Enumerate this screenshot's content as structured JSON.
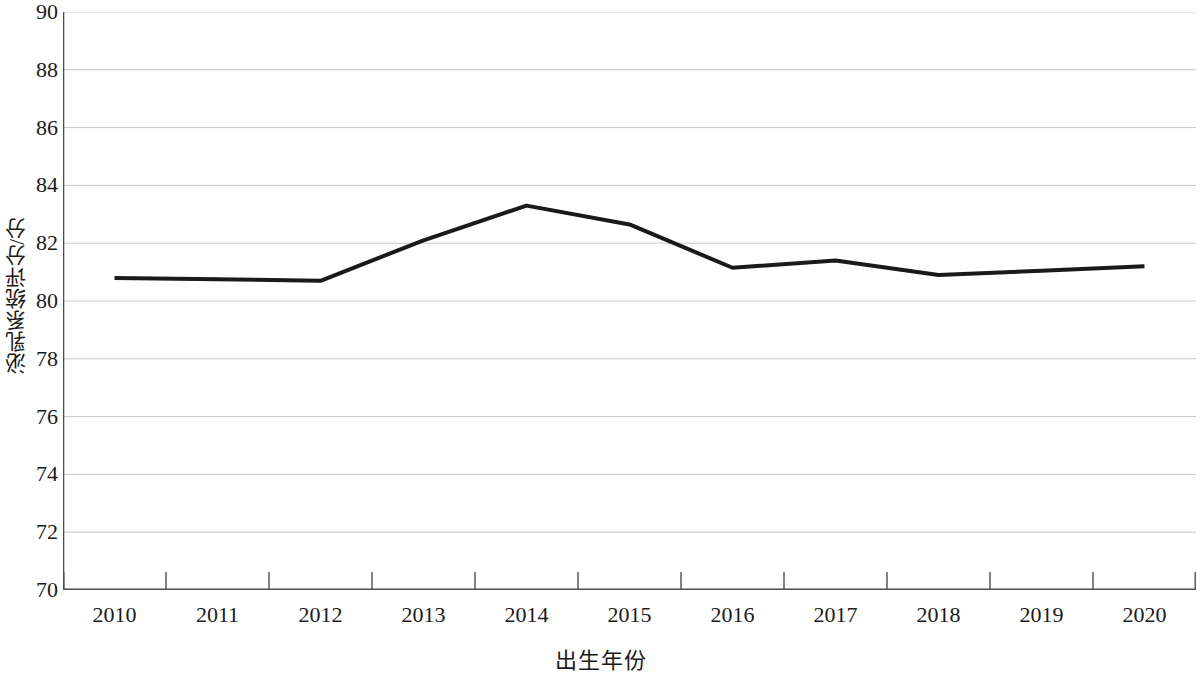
{
  "chart_data": {
    "type": "line",
    "title": "",
    "xlabel": "出生年份",
    "ylabel": "泌乳系统评分/分",
    "categories": [
      "2010",
      "2011",
      "2012",
      "2013",
      "2014",
      "2015",
      "2016",
      "2017",
      "2018",
      "2019",
      "2020"
    ],
    "series": [
      {
        "name": "泌乳系统评分",
        "values": [
          80.8,
          80.75,
          80.7,
          82.1,
          83.3,
          82.65,
          81.15,
          81.4,
          80.9,
          81.05,
          81.2
        ],
        "color": "#1a1a1a",
        "line_width": 4
      }
    ],
    "ylim": [
      70,
      90
    ],
    "y_ticks": [
      70,
      72,
      74,
      76,
      78,
      80,
      82,
      84,
      86,
      88,
      90
    ],
    "y_tick_labels": [
      "70",
      "72",
      "74",
      "76",
      "78",
      "80",
      "82",
      "84",
      "86",
      "88",
      "90"
    ],
    "grid": {
      "horizontal": true,
      "vertical": false,
      "color": "#c8c8c8"
    },
    "axis": {
      "color": "#4d4d4d",
      "left_spine": true,
      "bottom_spine": true,
      "top_spine": false,
      "right_spine": false,
      "tick_direction": "out"
    },
    "legend": {
      "visible": false,
      "position": "none"
    },
    "markers": "none",
    "background_color": "#ffffff"
  }
}
